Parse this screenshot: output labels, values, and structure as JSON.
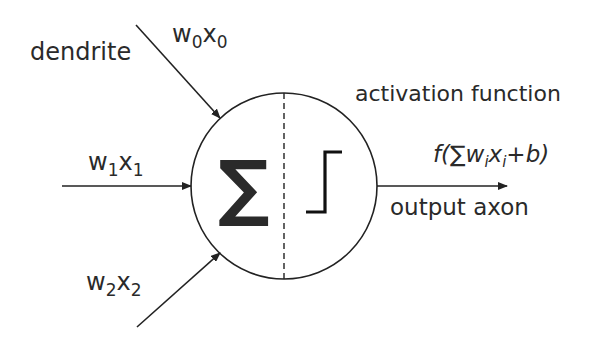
{
  "labels": {
    "dendrite": "dendrite",
    "input0_w": "w",
    "input0_wsub": "0",
    "input0_x": "x",
    "input0_xsub": "0",
    "input1_w": "w",
    "input1_wsub": "1",
    "input1_x": "x",
    "input1_xsub": "1",
    "input2_w": "w",
    "input2_wsub": "2",
    "input2_x": "x",
    "input2_xsub": "2",
    "activation": "activation function",
    "formula_pre": "f(∑w",
    "formula_i1": "i",
    "formula_mid": "x",
    "formula_i2": "i",
    "formula_post": "+b)",
    "output": "output axon",
    "sum_symbol": "∑"
  },
  "colors": {
    "stroke": "#222222",
    "text": "#2a2a2a",
    "background": "#ffffff"
  }
}
